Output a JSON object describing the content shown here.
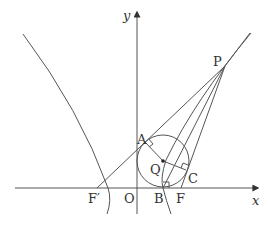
{
  "diagram": {
    "type": "hyperbola-with-inscribed-circle",
    "axes": {
      "x_label": "x",
      "y_label": "y",
      "origin_label": "O"
    },
    "points": [
      {
        "id": "P",
        "label": "P"
      },
      {
        "id": "A",
        "label": "A"
      },
      {
        "id": "Q",
        "label": "Q"
      },
      {
        "id": "C",
        "label": "C"
      },
      {
        "id": "B",
        "label": "B"
      },
      {
        "id": "F",
        "label": "F"
      },
      {
        "id": "F_prime",
        "label": "F′"
      }
    ],
    "annotations": {
      "right_angles": [
        "A",
        "C",
        "B"
      ]
    }
  }
}
